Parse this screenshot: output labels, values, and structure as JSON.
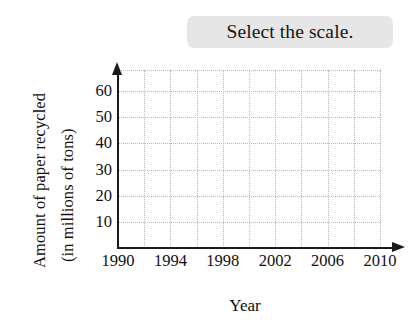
{
  "prompt": {
    "text": "Select the scale.",
    "highlight_color": "#e6e6e6"
  },
  "chart_data": {
    "type": "line",
    "title": "",
    "xlabel": "Year",
    "ylabel": "Amount of paper recycled (in millions of tons)",
    "ylabel_line1": "Amount of paper recycled",
    "ylabel_line2": "(in millions of tons)",
    "x": [],
    "values": [],
    "series": [],
    "xlim": [
      1990,
      2010
    ],
    "ylim": [
      0,
      68
    ],
    "x_ticks": [
      "1990",
      "1994",
      "1998",
      "2002",
      "2006",
      "2010"
    ],
    "x_tick_values": [
      1990,
      1994,
      1998,
      2002,
      2006,
      2010
    ],
    "y_ticks": [
      "10",
      "20",
      "30",
      "40",
      "50",
      "60"
    ],
    "y_tick_values": [
      10,
      20,
      30,
      40,
      50,
      60
    ],
    "x_gridline_values": [
      1992,
      1994,
      1996,
      1998,
      2000,
      2002,
      2004,
      2006,
      2008,
      2010
    ],
    "y_gridline_values": [
      10,
      20,
      30,
      40,
      50,
      60,
      68
    ],
    "grid": true,
    "grid_style": "dotted",
    "grid_color": "#b9b9b9",
    "axis_color": "#1a1a1a",
    "axis_arrows": true,
    "legend": null,
    "legend_position": "none",
    "data_points_plotted": 0,
    "note": "Empty grid - no data plotted; scale selection exercise"
  },
  "axis_geometry": {
    "plot_left_px": 118,
    "plot_top_px": 70,
    "plot_width_px": 262,
    "plot_height_px": 178,
    "x_tick_positions_px": [
      118,
      170,
      222,
      274,
      327,
      379
    ],
    "y_tick_positions_px": [
      224,
      200,
      177,
      153,
      130,
      106
    ]
  }
}
